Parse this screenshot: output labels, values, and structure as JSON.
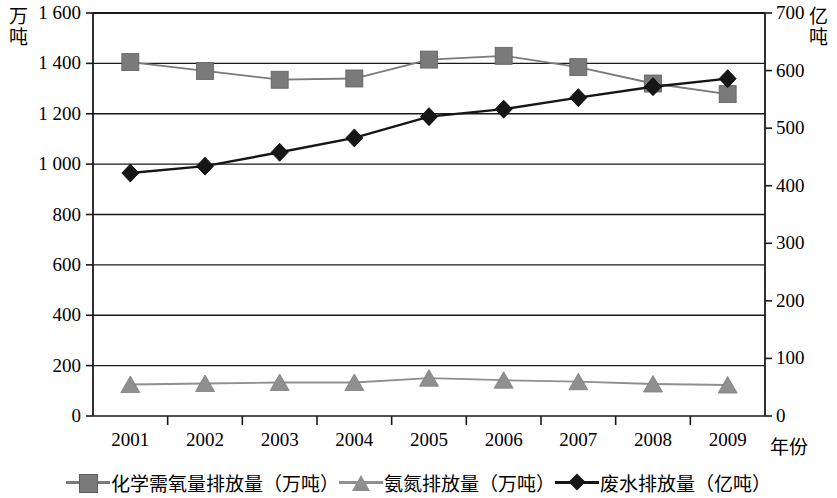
{
  "chart_data": {
    "type": "line",
    "title": "",
    "xlabel": "年份",
    "categories": [
      "2001",
      "2002",
      "2003",
      "2004",
      "2005",
      "2006",
      "2007",
      "2008",
      "2009"
    ],
    "left_axis": {
      "unit_label": "万\n吨",
      "ylim": [
        0,
        1600
      ],
      "ticks": [
        "0",
        "200",
        "400",
        "600",
        "800",
        "1 000",
        "1 200",
        "1 400",
        "1 600"
      ],
      "tick_values": [
        0,
        200,
        400,
        600,
        800,
        1000,
        1200,
        1400,
        1600
      ]
    },
    "right_axis": {
      "unit_label": "亿\n吨",
      "ylim": [
        0,
        700
      ],
      "ticks": [
        "0",
        "100",
        "200",
        "300",
        "400",
        "500",
        "600",
        "700"
      ],
      "tick_values": [
        0,
        100,
        200,
        300,
        400,
        500,
        600,
        700
      ]
    },
    "grid": true,
    "legend_position": "bottom",
    "series": [
      {
        "name": "化学需氧量排放量（万吨）",
        "axis": "left",
        "marker": "square",
        "color": "#7a7a7a",
        "values": [
          1405,
          1370,
          1335,
          1340,
          1415,
          1430,
          1385,
          1320,
          1278
        ]
      },
      {
        "name": "氨氮排放量（万吨）",
        "axis": "left",
        "marker": "triangle",
        "color": "#8f8f8f",
        "values": [
          125,
          129,
          133,
          133,
          150,
          142,
          136,
          127,
          123
        ]
      },
      {
        "name": "废水排放量（亿吨）",
        "axis": "right",
        "marker": "diamond",
        "color": "#161616",
        "values": [
          422,
          434,
          458,
          483,
          520,
          533,
          553,
          572,
          586
        ]
      }
    ]
  },
  "legend": {
    "items": [
      {
        "label": "化学需氧量排放量（万吨）",
        "marker": "square-marker"
      },
      {
        "label": "氨氮排放量（万吨）",
        "marker": "triangle-marker"
      },
      {
        "label": "废水排放量（亿吨）",
        "marker": "diamond-marker"
      }
    ]
  }
}
